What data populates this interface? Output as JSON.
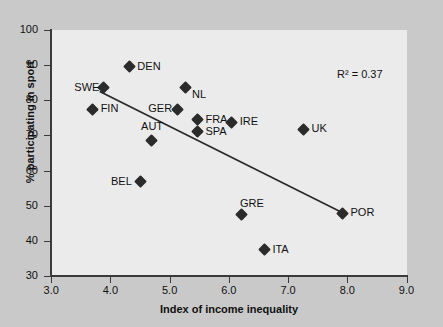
{
  "chart_data": {
    "type": "scatter",
    "title": "",
    "xlabel": "Index of income inequality",
    "ylabel": "% participating in sport",
    "xlim": [
      3.0,
      9.0
    ],
    "ylim": [
      30,
      100
    ],
    "xticks": [
      "3.0",
      "4.0",
      "5.0",
      "6.0",
      "7.0",
      "8.0",
      "9.0"
    ],
    "xtick_values": [
      3.0,
      4.0,
      5.0,
      6.0,
      7.0,
      8.0,
      9.0
    ],
    "yticks": [
      "30",
      "40",
      "50",
      "60",
      "70",
      "80",
      "90",
      "100"
    ],
    "ytick_values": [
      30,
      40,
      50,
      60,
      70,
      80,
      90,
      100
    ],
    "grid": false,
    "annotation": "R² = 0.37",
    "r_squared": 0.37,
    "points": [
      {
        "label": "SWE",
        "x": 3.89,
        "y": 83.5,
        "label_pos": "left"
      },
      {
        "label": "FIN",
        "x": 3.7,
        "y": 77.5,
        "label_pos": "right"
      },
      {
        "label": "DEN",
        "x": 4.32,
        "y": 89.5,
        "label_pos": "right"
      },
      {
        "label": "BEL",
        "x": 4.51,
        "y": 56.8,
        "label_pos": "left"
      },
      {
        "label": "AUT",
        "x": 4.7,
        "y": 68.5,
        "label_pos": "above"
      },
      {
        "label": "GER",
        "x": 5.14,
        "y": 77.5,
        "label_pos": "left"
      },
      {
        "label": "NL",
        "x": 5.26,
        "y": 83.5,
        "label_pos": "below-right"
      },
      {
        "label": "FRA",
        "x": 5.47,
        "y": 74.5,
        "label_pos": "right"
      },
      {
        "label": "SPA",
        "x": 5.47,
        "y": 71.0,
        "label_pos": "right"
      },
      {
        "label": "IRE",
        "x": 6.05,
        "y": 73.8,
        "label_pos": "right"
      },
      {
        "label": "GRE",
        "x": 6.22,
        "y": 47.5,
        "label_pos": "above-right"
      },
      {
        "label": "ITA",
        "x": 6.6,
        "y": 37.5,
        "label_pos": "right"
      },
      {
        "label": "UK",
        "x": 7.26,
        "y": 71.8,
        "label_pos": "right"
      },
      {
        "label": "POR",
        "x": 7.92,
        "y": 47.8,
        "label_pos": "right"
      }
    ],
    "trendline": {
      "x_start": 3.82,
      "y_start": 82.5,
      "x_end": 7.92,
      "y_end": 48.0,
      "color": "#2b2b2b"
    }
  },
  "colors": {
    "figure_background": "#c9c9c9",
    "panel_background": "#ebebeb",
    "axis": "#3a3a3a",
    "marker": "#2b2b2b",
    "text": "#111111"
  }
}
